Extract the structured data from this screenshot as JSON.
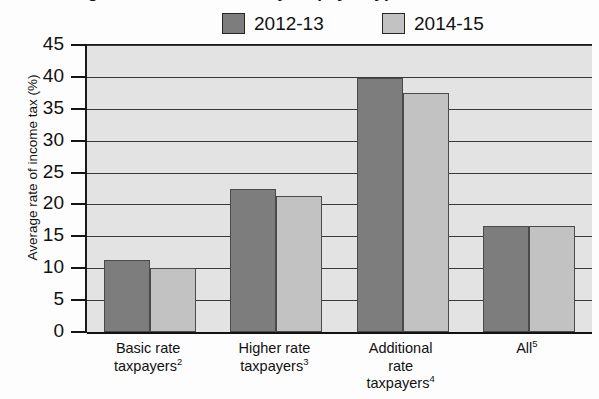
{
  "title": "Average rate of income tax by taxpayer type",
  "legend": {
    "position": "top",
    "items": [
      {
        "label": "2012-13",
        "color": "#7d7d7d",
        "name": "legend-2012-13"
      },
      {
        "label": "2014-15",
        "color": "#c2c2c2",
        "name": "legend-2014-15"
      }
    ]
  },
  "chart_data": {
    "type": "bar",
    "title": "Average rate of income tax by taxpayer type",
    "xlabel": "",
    "ylabel": "Average rate of income tax (%)",
    "ylim": [
      0,
      45
    ],
    "ytick_step": 5,
    "yticks": [
      "0",
      "5",
      "10",
      "15",
      "20",
      "25",
      "30",
      "35",
      "40",
      "45"
    ],
    "grid": true,
    "grid_axis": "y",
    "legend_position": "top",
    "categories": [
      "Basic rate taxpayers",
      "Higher rate taxpayers",
      "Additional rate taxpayers",
      "All"
    ],
    "category_footnotes": [
      "2",
      "3",
      "4",
      "5"
    ],
    "category_lines": [
      [
        "Basic rate",
        "taxpayers"
      ],
      [
        "Higher rate",
        "taxpayers"
      ],
      [
        "Additional",
        "rate",
        "taxpayers"
      ],
      [
        "All"
      ]
    ],
    "series": [
      {
        "name": "2012-13",
        "color": "#7d7d7d",
        "values": [
          11.3,
          22.5,
          39.8,
          16.6
        ]
      },
      {
        "name": "2014-15",
        "color": "#c2c2c2",
        "values": [
          10.1,
          21.4,
          37.5,
          16.6
        ]
      }
    ]
  },
  "axis": {
    "y_title": "Average rate of income tax (%)"
  },
  "colors": {
    "series_2012_13": "#7d7d7d",
    "series_2014_15": "#c2c2c2",
    "plot_background": "#e3e3e3",
    "axis": "#1a1a1a",
    "gridline": "#3a3a3a"
  }
}
